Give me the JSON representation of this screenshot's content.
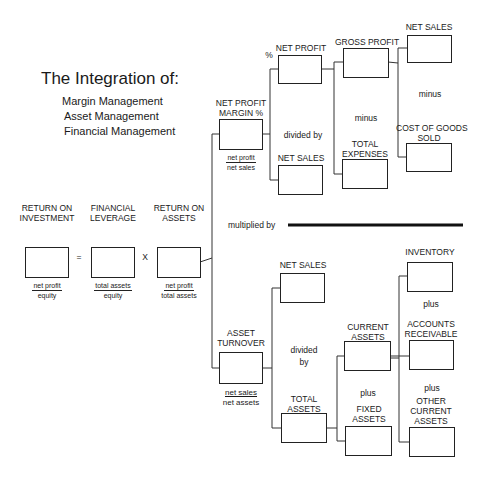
{
  "title": {
    "heading": "The Integration of:",
    "items": [
      "Margin Management",
      "Asset Management",
      "Financial Management"
    ]
  },
  "top_level": {
    "roi": {
      "label_line1": "RETURN ON",
      "label_line2": "INVESTMENT",
      "numerator": "net profit",
      "denominator": "equity"
    },
    "equals": "=",
    "fl": {
      "label_line1": "FINANCIAL",
      "label_line2": "LEVERAGE",
      "numerator": "total assets",
      "denominator": "equity"
    },
    "times": "X",
    "roa": {
      "label_line1": "RETURN ON",
      "label_line2": "ASSETS",
      "numerator": "net profit",
      "denominator": "total assets"
    }
  },
  "margin_branch": {
    "npm": {
      "label_line1": "NET PROFIT",
      "label_line2": "MARGIN %",
      "numerator": "net profit",
      "denominator": "net sales"
    },
    "percent": "%",
    "net_profit": {
      "label": "NET PROFIT"
    },
    "divided_by": "divided by",
    "net_sales": {
      "label": "NET SALES"
    },
    "gross_profit": {
      "label": "GROSS PROFIT"
    },
    "minus_1": "minus",
    "total_expenses": {
      "label_line1": "TOTAL",
      "label_line2": "EXPENSES"
    },
    "net_sales_top": {
      "label": "NET SALES"
    },
    "minus_2": "minus",
    "cogs": {
      "label_line1": "COST OF GOODS",
      "label_line2": "SOLD"
    }
  },
  "multiplied_by": "multiplied by",
  "asset_branch": {
    "asset_turnover": {
      "label_line1": "ASSET",
      "label_line2": "TURNOVER",
      "numerator": "net sales",
      "denominator": "net assets"
    },
    "net_sales": {
      "label": "NET SALES"
    },
    "divided_line1": "divided",
    "divided_line2": "by",
    "total_assets": {
      "label_line1": "TOTAL",
      "label_line2": "ASSETS"
    },
    "current_assets": {
      "label_line1": "CURRENT",
      "label_line2": "ASSETS"
    },
    "plus_1": "plus",
    "fixed_assets": {
      "label_line1": "FIXED",
      "label_line2": "ASSETS"
    },
    "inventory": {
      "label": "INVENTORY"
    },
    "plus_2": "plus",
    "accounts_receivable": {
      "label_line1": "ACCOUNTS",
      "label_line2": "RECEIVABLE"
    },
    "plus_3": "plus",
    "other_current_assets": {
      "label_line1": "OTHER",
      "label_line2": "CURRENT",
      "label_line3": "ASSETS"
    }
  }
}
